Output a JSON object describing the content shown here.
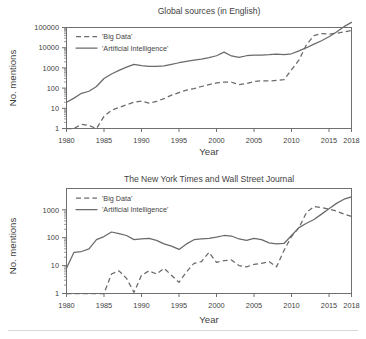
{
  "figure": {
    "axis_label_x": "Year",
    "axis_label_y": "No. mentions"
  },
  "panels": [
    {
      "id": "global-sources",
      "title": "Global sources (in English)",
      "legend": [
        {
          "label": "'Big Data'",
          "style": "dashed"
        },
        {
          "label": "'Artificial Intelligence'",
          "style": "solid"
        }
      ],
      "xticks": [
        "1980",
        "1985",
        "1990",
        "1995",
        "2000",
        "2005",
        "2010",
        "2015",
        "2018"
      ],
      "yticks": [
        "1",
        "10",
        "100",
        "1000",
        "10000",
        "100000"
      ]
    },
    {
      "id": "nyt-wsj",
      "title": "The New York Times and Wall Street Journal",
      "legend": [
        {
          "label": "'Big Data'",
          "style": "dashed"
        },
        {
          "label": "'Artificial Intelligence'",
          "style": "solid"
        }
      ],
      "xticks": [
        "1980",
        "1985",
        "1990",
        "1995",
        "2000",
        "2005",
        "2010",
        "2015",
        "2018"
      ],
      "yticks": [
        "1",
        "10",
        "100",
        "1000"
      ]
    }
  ],
  "chart_data": [
    {
      "type": "line",
      "title": "Global sources (in English)",
      "xlabel": "Year",
      "ylabel": "No. mentions",
      "yscale": "log",
      "xlim": [
        1980,
        2018
      ],
      "ylim": [
        1,
        300000
      ],
      "grid": false,
      "legend_position": "top-left",
      "x": [
        1980,
        1981,
        1982,
        1983,
        1984,
        1985,
        1986,
        1987,
        1988,
        1989,
        1990,
        1991,
        1992,
        1993,
        1994,
        1995,
        1996,
        1997,
        1998,
        1999,
        2000,
        2001,
        2002,
        2003,
        2004,
        2005,
        2006,
        2007,
        2008,
        2009,
        2010,
        2011,
        2012,
        2013,
        2014,
        2015,
        2016,
        2017,
        2018
      ],
      "series": [
        {
          "name": "'Big Data'",
          "style": "dashed",
          "values": [
            1,
            1,
            1.6,
            1.4,
            1,
            4,
            8,
            11,
            15,
            20,
            23,
            18,
            22,
            30,
            45,
            60,
            80,
            95,
            120,
            150,
            180,
            200,
            195,
            150,
            170,
            210,
            230,
            225,
            240,
            260,
            800,
            2500,
            14000,
            40000,
            50000,
            47000,
            52000,
            60000,
            72000
          ]
        },
        {
          "name": "'Artificial Intelligence'",
          "style": "solid",
          "values": [
            20,
            32,
            55,
            70,
            120,
            300,
            500,
            750,
            1100,
            1500,
            1300,
            1200,
            1200,
            1250,
            1500,
            1800,
            2100,
            2400,
            2700,
            3200,
            4000,
            6000,
            3900,
            3300,
            4000,
            4300,
            4300,
            4500,
            4800,
            4500,
            5000,
            7000,
            10000,
            15000,
            22000,
            35000,
            60000,
            110000,
            180000
          ]
        }
      ]
    },
    {
      "type": "line",
      "title": "The New York Times and Wall Street Journal",
      "xlabel": "Year",
      "ylabel": "No. mentions",
      "yscale": "log",
      "xlim": [
        1980,
        2018
      ],
      "ylim": [
        1,
        5000
      ],
      "grid": false,
      "legend_position": "top-left",
      "x": [
        1980,
        1981,
        1982,
        1983,
        1984,
        1985,
        1986,
        1987,
        1988,
        1989,
        1990,
        1991,
        1992,
        1993,
        1994,
        1995,
        1996,
        1997,
        1998,
        1999,
        2000,
        2001,
        2002,
        2003,
        2004,
        2005,
        2006,
        2007,
        2008,
        2009,
        2010,
        2011,
        2012,
        2013,
        2014,
        2015,
        2016,
        2017,
        2018
      ],
      "series": [
        {
          "name": "'Big Data'",
          "style": "dashed",
          "values": [
            1,
            1,
            1,
            1,
            1,
            1,
            5,
            6.5,
            3.5,
            1.1,
            4.5,
            6.5,
            5,
            8,
            4.5,
            2.5,
            6,
            12,
            14,
            30,
            13,
            15,
            16,
            10,
            9,
            11,
            12,
            14,
            9,
            35,
            110,
            230,
            800,
            1300,
            1200,
            1050,
            900,
            700,
            580
          ]
        },
        {
          "name": "'Artificial Intelligence'",
          "style": "solid",
          "values": [
            8,
            30,
            32,
            40,
            85,
            110,
            160,
            140,
            120,
            85,
            90,
            95,
            80,
            60,
            50,
            38,
            60,
            85,
            90,
            95,
            105,
            120,
            115,
            90,
            80,
            95,
            85,
            65,
            60,
            62,
            120,
            230,
            330,
            450,
            700,
            1100,
            1700,
            2400,
            2900
          ]
        }
      ]
    }
  ]
}
